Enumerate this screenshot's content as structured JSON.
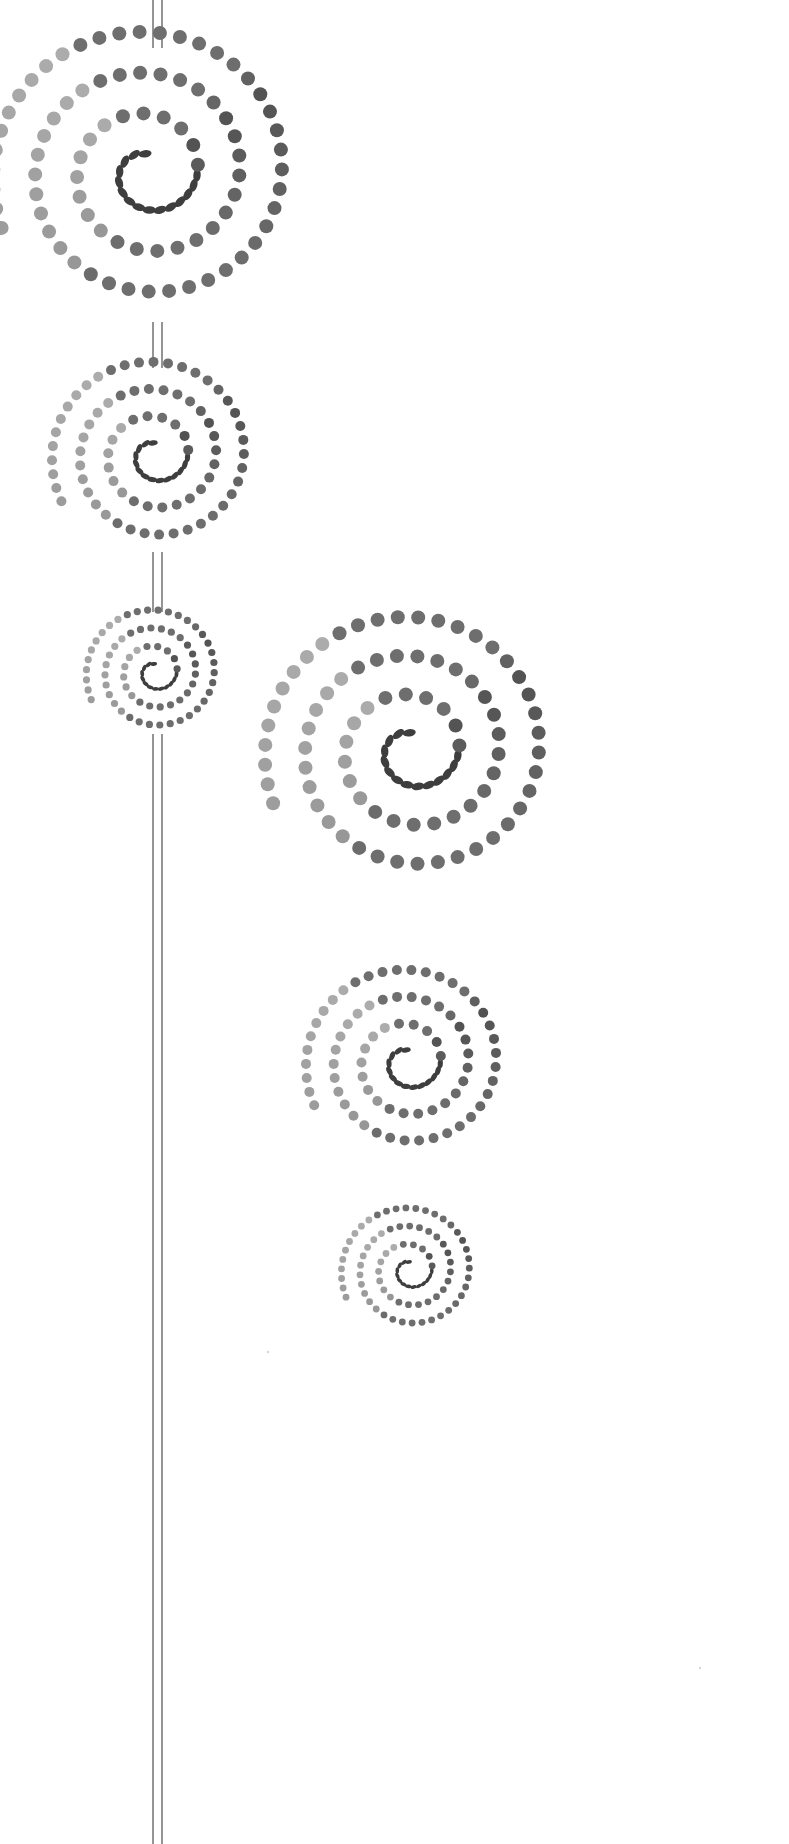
{
  "canvas": {
    "width": 789,
    "height": 1844,
    "background": "#ffffff"
  },
  "stem": {
    "x_left": 153,
    "x_right": 162,
    "color": "#7a7a7a",
    "segments": [
      {
        "y1": 0,
        "y2": 48
      },
      {
        "y1": 322,
        "y2": 368
      },
      {
        "y1": 552,
        "y2": 612
      },
      {
        "y1": 734,
        "y2": 1844
      }
    ]
  },
  "spirals": [
    {
      "name": "spiral-large-top-left",
      "cx": 148,
      "cy": 172,
      "radius": 158,
      "dot": 7.0,
      "turns": 3.3
    },
    {
      "name": "spiral-medium-left",
      "cx": 155,
      "cy": 455,
      "radius": 105,
      "dot": 5.0,
      "turns": 3.3
    },
    {
      "name": "spiral-large-right",
      "cx": 412,
      "cy": 750,
      "radius": 150,
      "dot": 7.0,
      "turns": 3.3
    },
    {
      "name": "spiral-small-left",
      "cx": 155,
      "cy": 672,
      "radius": 70,
      "dot": 3.6,
      "turns": 3.3
    },
    {
      "name": "spiral-medium-right",
      "cx": 408,
      "cy": 1062,
      "radius": 104,
      "dot": 5.0,
      "turns": 3.3
    },
    {
      "name": "spiral-small-right",
      "cx": 410,
      "cy": 1270,
      "radius": 70,
      "dot": 3.4,
      "turns": 3.3
    }
  ],
  "palette": {
    "dark": "#2a2a2a",
    "mid": "#6e6e6e",
    "light": "#c4c4c4"
  },
  "specks": [
    {
      "x": 268,
      "y": 1352
    },
    {
      "x": 700,
      "y": 1668
    }
  ]
}
